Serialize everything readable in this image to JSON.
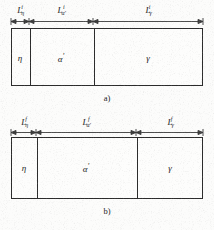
{
  "figure": {
    "type": "schematic-diagram",
    "line_color": "#2b2b2b",
    "background_color": "#fcfcfb",
    "panels": [
      {
        "id": "a",
        "caption": "a)",
        "superscript": "i",
        "dimensions": [
          {
            "base": "L",
            "sub": "η",
            "sup": "i",
            "x_start": 11,
            "x_end": 29,
            "label_x": 20
          },
          {
            "base": "L",
            "sub": "α′",
            "sup": "i",
            "x_start": 29,
            "x_end": 93,
            "label_x": 61
          },
          {
            "base": "L",
            "sub": "γ",
            "sup": "i",
            "x_start": 93,
            "x_end": 203,
            "label_x": 148
          }
        ],
        "box": {
          "x": 11,
          "y": 28,
          "width": 192,
          "height": 58
        },
        "dividers": [
          29,
          93
        ],
        "regions": [
          {
            "name": "η",
            "prime": "",
            "center_x": 20,
            "center_y": 58
          },
          {
            "name": "α",
            "prime": "′",
            "center_x": 61,
            "center_y": 58
          },
          {
            "name": "γ",
            "prime": "",
            "center_x": 148,
            "center_y": 58
          }
        ],
        "caption_x": 107,
        "caption_y": 93
      },
      {
        "id": "b",
        "caption": "b)",
        "superscript": "f",
        "dimensions": [
          {
            "base": "L",
            "sub": "η",
            "sup": "f",
            "x_start": 11,
            "x_end": 36,
            "label_x": 24
          },
          {
            "base": "L",
            "sub": "α′",
            "sup": "f",
            "x_start": 36,
            "x_end": 136,
            "label_x": 86
          },
          {
            "base": "L",
            "sub": "γ",
            "sup": "f",
            "x_start": 136,
            "x_end": 203,
            "label_x": 170
          }
        ],
        "box": {
          "x": 11,
          "y": 25,
          "width": 192,
          "height": 62
        },
        "dividers": [
          36,
          136
        ],
        "regions": [
          {
            "name": "η",
            "prime": "",
            "center_x": 24,
            "center_y": 56
          },
          {
            "name": "α",
            "prime": "′",
            "center_x": 86,
            "center_y": 56
          },
          {
            "name": "γ",
            "prime": "",
            "center_x": 170,
            "center_y": 56
          }
        ],
        "caption_x": 107,
        "caption_y": 94
      }
    ]
  }
}
